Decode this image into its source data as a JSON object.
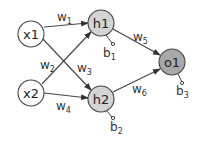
{
  "diagram": {
    "type": "neural-network",
    "colors": {
      "input_fill": "#ffffff",
      "hidden_fill": "#d4d4d4",
      "output_fill": "#a8a8a8",
      "stroke": "#444444"
    },
    "nodes": [
      {
        "id": "x1",
        "label": "x1",
        "layer": "input"
      },
      {
        "id": "x2",
        "label": "x2",
        "layer": "input"
      },
      {
        "id": "h1",
        "label": "h1",
        "layer": "hidden"
      },
      {
        "id": "h2",
        "label": "h2",
        "layer": "hidden"
      },
      {
        "id": "o1",
        "label": "o1",
        "layer": "output"
      }
    ],
    "edges": [
      {
        "from": "x1",
        "to": "h1",
        "weight": "w",
        "sub": "1"
      },
      {
        "from": "x2",
        "to": "h1",
        "weight": "w",
        "sub": "2"
      },
      {
        "from": "x1",
        "to": "h2",
        "weight": "w",
        "sub": "3"
      },
      {
        "from": "x2",
        "to": "h2",
        "weight": "w",
        "sub": "4"
      },
      {
        "from": "h1",
        "to": "o1",
        "weight": "w",
        "sub": "5"
      },
      {
        "from": "h2",
        "to": "o1",
        "weight": "w",
        "sub": "6"
      }
    ],
    "biases": [
      {
        "node": "h1",
        "label": "b",
        "sub": "1"
      },
      {
        "node": "h2",
        "label": "b",
        "sub": "2"
      },
      {
        "node": "o1",
        "label": "b",
        "sub": "3"
      }
    ]
  }
}
